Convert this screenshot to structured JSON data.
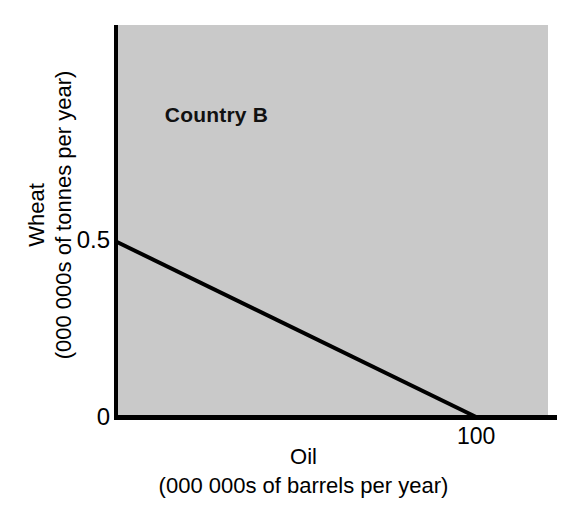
{
  "figure": {
    "background_color": "#ffffff",
    "plot_fill_color": "#c9c9c9",
    "axis_color": "#000000",
    "line_color": "#000000"
  },
  "labels": {
    "region": "Country B",
    "y_axis_title": "Wheat",
    "y_axis_units": "(000 000s of tonnes per year)",
    "x_axis_title": "Oil",
    "x_axis_units": "(000 000s of  barrels per year)",
    "y_tick_upper": "0.5",
    "y_tick_lower": "0",
    "x_tick": "100"
  },
  "chart_data": {
    "type": "line",
    "title": "Country B",
    "xlabel": "Oil (000 000s of barrels per year)",
    "ylabel": "Wheat (000 000s of tonnes per year)",
    "xlim": [
      0,
      120
    ],
    "ylim": [
      0,
      1.12
    ],
    "xticks": [
      100
    ],
    "xticklabels": [
      "100"
    ],
    "yticks": [
      0,
      0.5
    ],
    "yticklabels": [
      "0",
      "0.5"
    ],
    "grid": false,
    "legend": null,
    "annotations": [
      {
        "text": "Country B",
        "x": 65,
        "y": 0.84,
        "bold": true
      }
    ],
    "series": [
      {
        "name": "Production possibility frontier",
        "x": [
          0,
          100
        ],
        "y": [
          0.5,
          0
        ],
        "slope": -0.005,
        "intercept": 0.5,
        "linewidth": 4,
        "color": "#000000"
      }
    ]
  }
}
